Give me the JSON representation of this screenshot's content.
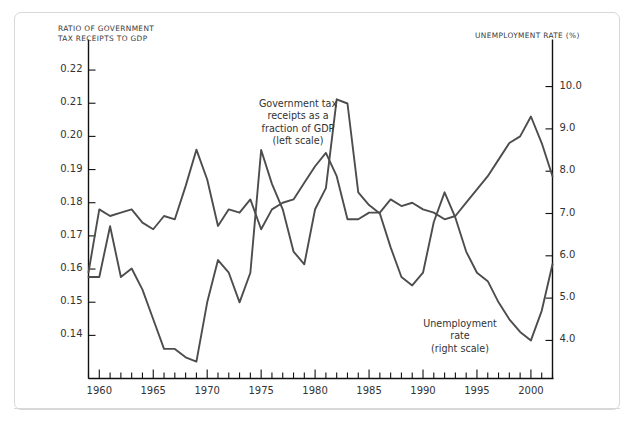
{
  "figure": {
    "left_axis_title": "RATIO OF GOVERNMENT\nTAX RECEIPTS TO GDP",
    "right_axis_title": "UNEMPLOYMENT RATE (%)",
    "annotation_tax": "Government tax\nreceipts as a\nfraction of GDP\n(left scale)",
    "annotation_unemployment": "Unemployment\nrate\n(right scale)"
  },
  "colors": {
    "line": "#4d4d4d",
    "axis": "#111111",
    "text": "#333333",
    "frame": "#d8d8d8",
    "background": "#ffffff"
  },
  "chart_data": {
    "type": "line",
    "title": "",
    "subtitle": "",
    "xlabel": "",
    "ylabel": "RATIO OF GOVERNMENT TAX RECEIPTS TO GDP",
    "y2label": "UNEMPLOYMENT RATE (%)",
    "grid": false,
    "legend": "annotations-inline",
    "xlim": [
      1959,
      2002
    ],
    "ylim": [
      0.127,
      0.2265
    ],
    "y2lim": [
      3.1,
      10.9
    ],
    "xticks_major": [
      1960,
      1965,
      1970,
      1975,
      1980,
      1985,
      1990,
      1995,
      2000
    ],
    "xticks_minor_every": 1,
    "yticks_left": [
      0.14,
      0.15,
      0.16,
      0.17,
      0.18,
      0.19,
      0.2,
      0.21,
      0.22
    ],
    "ytick_labels_left": [
      "0.14",
      "0.15",
      "0.16",
      "0.17",
      "0.18",
      "0.19",
      "0.20",
      "0.21",
      "0.22"
    ],
    "yticks_right": [
      4.0,
      5.0,
      6.0,
      7.0,
      8.0,
      9.0,
      10.0
    ],
    "ytick_labels_right": [
      "4.0",
      "5.0",
      "6.0",
      "7.0",
      "8.0",
      "9.0",
      "10.0"
    ],
    "x": [
      1959,
      1960,
      1961,
      1962,
      1963,
      1964,
      1965,
      1966,
      1967,
      1968,
      1969,
      1970,
      1971,
      1972,
      1973,
      1974,
      1975,
      1976,
      1977,
      1978,
      1979,
      1980,
      1981,
      1982,
      1983,
      1984,
      1985,
      1986,
      1987,
      1988,
      1989,
      1990,
      1991,
      1992,
      1993,
      1994,
      1995,
      1996,
      1997,
      1998,
      1999,
      2000,
      2001,
      2002
    ],
    "series": [
      {
        "name": "Government tax receipts as a fraction of GDP (left scale)",
        "axis": "left",
        "label": "Government tax receipts as a fraction of GDP (left scale)",
        "values": [
          0.159,
          0.178,
          0.176,
          0.177,
          0.178,
          0.174,
          0.172,
          0.176,
          0.175,
          0.185,
          0.196,
          0.187,
          0.173,
          0.178,
          0.177,
          0.181,
          0.172,
          0.178,
          0.18,
          0.181,
          0.186,
          0.191,
          0.195,
          0.188,
          0.175,
          0.175,
          0.177,
          0.177,
          0.181,
          0.179,
          0.18,
          0.178,
          0.177,
          0.175,
          0.176,
          0.18,
          0.184,
          0.188,
          0.193,
          0.198,
          0.2,
          0.206,
          0.198,
          0.188
        ]
      },
      {
        "name": "Unemployment rate (right scale)",
        "axis": "right",
        "label": "Unemployment rate (right scale)",
        "values": [
          5.5,
          5.5,
          6.7,
          5.5,
          5.7,
          5.2,
          4.5,
          3.8,
          3.8,
          3.6,
          3.5,
          4.9,
          5.9,
          5.6,
          4.9,
          5.6,
          8.5,
          7.7,
          7.1,
          6.1,
          5.8,
          7.1,
          7.6,
          9.7,
          9.6,
          7.5,
          7.2,
          7.0,
          6.2,
          5.5,
          5.3,
          5.6,
          6.8,
          7.5,
          6.9,
          6.1,
          5.6,
          5.4,
          4.9,
          4.5,
          4.2,
          4.0,
          4.7,
          5.8
        ]
      }
    ],
    "notable_points": {
      "tax_peak": {
        "year": 2000,
        "value": 0.206
      },
      "tax_min": {
        "year": 1959,
        "value": 0.159
      },
      "unemployment_peak": {
        "year": 1982,
        "value": 9.7
      },
      "unemployment_min": {
        "year": 2000,
        "value": 4.0
      }
    }
  }
}
